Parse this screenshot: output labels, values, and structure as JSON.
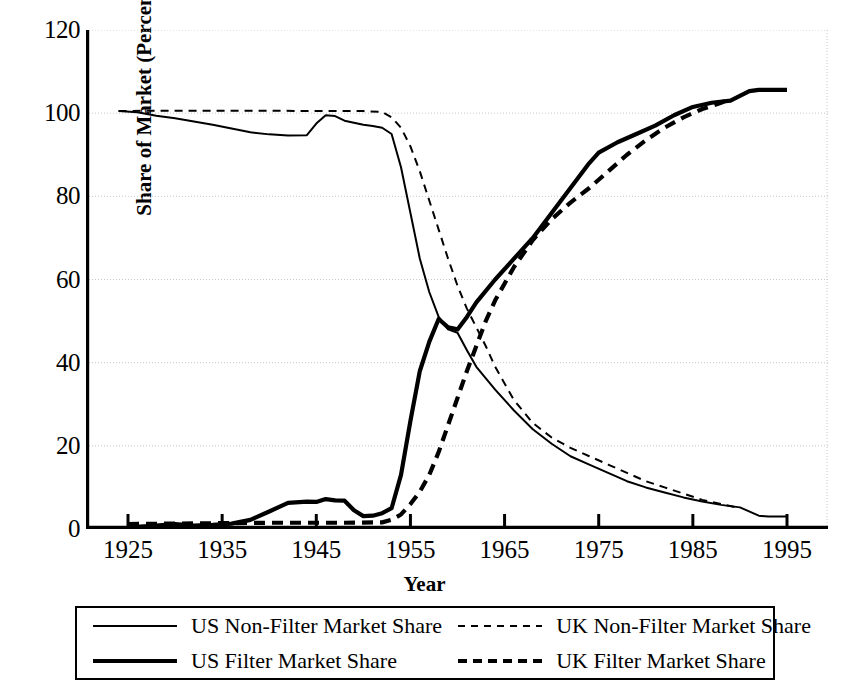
{
  "chart_data": {
    "type": "line",
    "title": "",
    "xlabel": "Year",
    "ylabel": "Share of Market (Percent)",
    "xlim": [
      1920,
      1999
    ],
    "ylim": [
      0,
      120
    ],
    "xticks": [
      1925,
      1935,
      1945,
      1955,
      1965,
      1975,
      1985,
      1995
    ],
    "xtick_labels": [
      "1925",
      "1935",
      "1945",
      "1955",
      "1965",
      "1975",
      "1985",
      "1995"
    ],
    "yticks": [
      0,
      20,
      40,
      60,
      80,
      100,
      120
    ],
    "ytick_labels": [
      "0",
      "20",
      "40",
      "60",
      "80",
      "100",
      "120"
    ],
    "grid": true,
    "grid_axis": "y",
    "legend_position": "below",
    "series": [
      {
        "name": "US Non-Filter Market Share",
        "style": "solid",
        "width": "thin",
        "color": "#000000",
        "x": [
          1924,
          1926,
          1928,
          1930,
          1932,
          1934,
          1936,
          1938,
          1940,
          1942,
          1944,
          1945,
          1946,
          1947,
          1948,
          1950,
          1951,
          1952,
          1953,
          1954,
          1955,
          1956,
          1957,
          1958,
          1959,
          1960,
          1961,
          1962,
          1964,
          1966,
          1968,
          1970,
          1972,
          1974,
          1976,
          1978,
          1980,
          1982,
          1984,
          1986,
          1988,
          1990,
          1992,
          1993,
          1995
        ],
        "y": [
          100.5,
          100.2,
          99.4,
          98.8,
          98.0,
          97.2,
          96.3,
          95.4,
          94.9,
          94.6,
          94.7,
          97.5,
          99.5,
          99.3,
          98.2,
          97.2,
          96.9,
          96.5,
          95.0,
          87.0,
          76.0,
          65.0,
          57.0,
          51.0,
          48.0,
          47.2,
          43.0,
          39.0,
          33.5,
          28.5,
          24.0,
          20.5,
          17.5,
          15.5,
          13.5,
          11.5,
          10.0,
          8.8,
          7.6,
          6.6,
          5.8,
          5.2,
          3.2,
          3.0,
          3.0
        ]
      },
      {
        "name": "UK Non-Filter Market Share",
        "style": "dashed",
        "width": "thin",
        "color": "#000000",
        "x": [
          1924,
          1928,
          1932,
          1936,
          1940,
          1944,
          1948,
          1950,
          1952,
          1953,
          1954,
          1955,
          1956,
          1957,
          1958,
          1959,
          1960,
          1961,
          1962,
          1963,
          1964,
          1965,
          1966,
          1968,
          1970,
          1972,
          1974,
          1976,
          1978,
          1980,
          1982,
          1984,
          1986,
          1988,
          1990
        ],
        "y": [
          100.5,
          100.6,
          100.6,
          100.6,
          100.6,
          100.5,
          100.5,
          100.5,
          100.3,
          99.0,
          96.5,
          92.0,
          86.0,
          79.0,
          72.0,
          65.0,
          58.5,
          53.0,
          48.5,
          44.0,
          39.0,
          35.0,
          31.0,
          25.5,
          22.0,
          19.5,
          17.5,
          15.5,
          13.5,
          11.5,
          10.0,
          8.5,
          7.0,
          6.0,
          5.0
        ]
      },
      {
        "name": "US Filter Market Share",
        "style": "solid",
        "width": "thick",
        "color": "#000000",
        "x": [
          1925,
          1928,
          1930,
          1932,
          1934,
          1936,
          1938,
          1940,
          1942,
          1944,
          1945,
          1946,
          1947,
          1948,
          1949,
          1950,
          1951,
          1952,
          1953,
          1954,
          1955,
          1956,
          1957,
          1958,
          1959,
          1960,
          1961,
          1962,
          1964,
          1966,
          1968,
          1970,
          1972,
          1974,
          1975,
          1977,
          1979,
          1981,
          1983,
          1985,
          1987,
          1989,
          1991,
          1992,
          1995
        ],
        "y": [
          0.4,
          0.8,
          1.2,
          0.8,
          1.0,
          1.3,
          2.2,
          4.2,
          6.3,
          6.6,
          6.5,
          7.2,
          6.9,
          6.8,
          4.5,
          3.1,
          3.2,
          3.8,
          5.0,
          13.0,
          26.0,
          38.0,
          45.0,
          50.5,
          48.5,
          48.0,
          51.0,
          54.5,
          60.0,
          65.0,
          70.0,
          76.0,
          82.0,
          88.0,
          90.5,
          93.0,
          95.0,
          97.0,
          99.5,
          101.5,
          102.5,
          103.0,
          105.3,
          105.6,
          105.6
        ]
      },
      {
        "name": "UK Filter Market Share",
        "style": "dashed",
        "width": "thick",
        "color": "#000000",
        "x": [
          1925,
          1930,
          1935,
          1940,
          1944,
          1948,
          1952,
          1953,
          1954,
          1955,
          1956,
          1957,
          1958,
          1959,
          1960,
          1961,
          1962,
          1963,
          1964,
          1966,
          1968,
          1970,
          1972,
          1974,
          1976,
          1978,
          1980,
          1982,
          1984,
          1986,
          1988,
          1989
        ],
        "y": [
          1.2,
          1.3,
          1.4,
          1.5,
          1.5,
          1.5,
          1.6,
          2.2,
          3.5,
          6.0,
          9.0,
          13.0,
          18.5,
          25.0,
          31.5,
          38.0,
          44.0,
          50.0,
          55.0,
          63.0,
          69.5,
          74.5,
          78.5,
          82.0,
          86.0,
          90.0,
          93.5,
          96.5,
          99.0,
          101.0,
          102.5,
          103.5
        ]
      }
    ]
  },
  "axis": {
    "ylabel": "Share of Market (Percent)",
    "xlabel": "Year"
  },
  "legend": {
    "entries": [
      {
        "label": "US Non-Filter Market Share",
        "style": "solid",
        "width": "thin"
      },
      {
        "label": "UK Non-Filter Market Share",
        "style": "dashed",
        "width": "thin"
      },
      {
        "label": "US Filter Market Share",
        "style": "solid",
        "width": "thick"
      },
      {
        "label": "UK Filter Market Share",
        "style": "dashed",
        "width": "thick"
      }
    ]
  },
  "colors": {
    "line": "#000000",
    "grid": "#c8c8c8",
    "axis": "#000000",
    "background": "#ffffff"
  }
}
